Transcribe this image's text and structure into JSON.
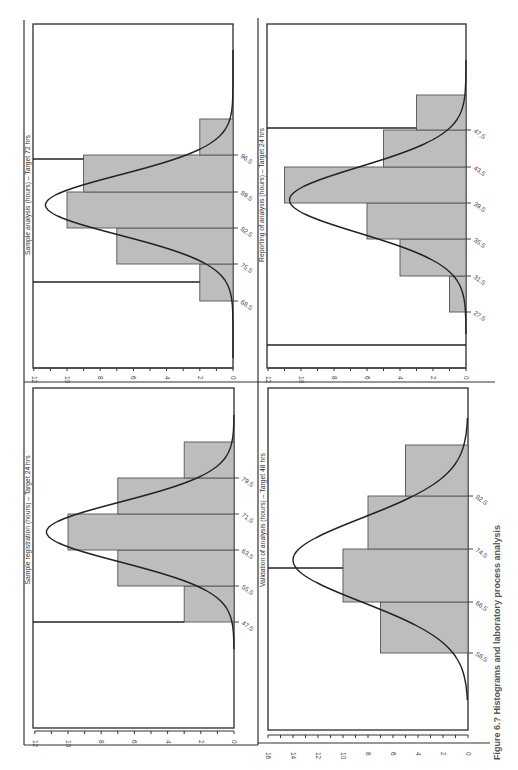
{
  "figure": {
    "caption": "Figure 6.? Histograms and laboratory process analysis",
    "orientation": "rotated 90°"
  },
  "chart_data": [
    {
      "type": "bar",
      "title": "Sample analysis (hours) – Target 72 hrs",
      "xlabel": "Hours",
      "ylabel": "Frequency",
      "bin_edges": [
        68.5,
        75.5,
        82.5,
        89.5,
        96.5
      ],
      "categories": [
        "61.5–68.5",
        "68.5–75.5",
        "75.5–82.5",
        "82.5–89.5",
        "89.5–96.5",
        "96.5–103.5"
      ],
      "values": [
        2,
        2,
        7,
        10,
        9,
        2
      ],
      "normal_curve_peak": 11.3,
      "ylim": [
        0,
        12
      ],
      "yticks": [
        "0",
        "2",
        "4",
        "6",
        "8",
        "10",
        "12"
      ],
      "spec_lines": [
        "lower limit",
        "upper limit"
      ]
    },
    {
      "type": "bar",
      "title": "Reporting of analysis (hours) – Target 24 hrs",
      "xlabel": "Hours",
      "ylabel": "Frequency",
      "bin_edges": [
        27.5,
        31.5,
        35.5,
        39.5,
        43.5,
        47.5
      ],
      "categories": [
        "27.5–31.5",
        "31.5–35.5",
        "35.5–39.5",
        "39.5–43.5",
        "43.5–47.5",
        "47.5–51.5"
      ],
      "values": [
        1,
        4,
        6,
        11,
        5,
        3
      ],
      "normal_curve_peak": 10.7,
      "ylim": [
        0,
        12
      ],
      "yticks": [
        "0",
        "2",
        "4",
        "6",
        "8",
        "10",
        "12"
      ],
      "spec_lines": [
        "lower limit",
        "upper limit"
      ]
    },
    {
      "type": "bar",
      "title": "Sample registration (hours) – Target 24 hrs",
      "xlabel": "Hours",
      "ylabel": "Frequency",
      "bin_edges": [
        47.5,
        55.5,
        63.5,
        71.5,
        79.5
      ],
      "categories": [
        "47.5–55.5",
        "55.5–63.5",
        "63.5–71.5",
        "71.5–79.5",
        "79.5–87.5"
      ],
      "values": [
        3,
        7,
        10,
        7,
        3
      ],
      "normal_curve_peak": 11.3,
      "ylim": [
        0,
        12
      ],
      "yticks": [
        "0",
        "2",
        "4",
        "6",
        "8",
        "10",
        "12"
      ],
      "spec_lines": [
        "lower limit"
      ]
    },
    {
      "type": "bar",
      "title": "Validation of analysis (hours) – Target 48 hrs",
      "xlabel": "Hours",
      "ylabel": "Frequency",
      "bin_edges": [
        58.5,
        66.5,
        74.5,
        82.5
      ],
      "categories": [
        "58.5–66.5",
        "66.5–74.5",
        "74.5–82.5",
        "82.5–90.5"
      ],
      "values": [
        7,
        10,
        8,
        5
      ],
      "normal_curve_peak": 14,
      "ylim": [
        0,
        16
      ],
      "yticks": [
        "0",
        "2",
        "4",
        "6",
        "8",
        "10",
        "12",
        "14",
        "16"
      ],
      "spec_lines": [
        "target limit"
      ]
    }
  ],
  "layout_panels": [
    {
      "frame": {
        "x": 33,
        "y": 24,
        "right": 233,
        "bottom": 368
      },
      "title_x": 30,
      "title_y": 195,
      "base_x": 233,
      "scale": 16.6,
      "vmax": 12,
      "tick_y": 368,
      "label_y": 376,
      "edges_y": [
        301,
        264,
        228,
        192,
        155
      ],
      "edge_labels": [
        "68.5",
        "75.5",
        "82.5",
        "89.5",
        "96.5"
      ],
      "bars": [
        {
          "y0": 264,
          "y1": 301,
          "v": 2
        },
        {
          "y0": 228,
          "y1": 264,
          "v": 7
        },
        {
          "y0": 192,
          "y1": 228,
          "v": 10
        },
        {
          "y0": 155,
          "y1": 192,
          "v": 9
        },
        {
          "y0": 119,
          "y1": 155,
          "v": 2
        }
      ],
      "curve": {
        "mu_y": 205,
        "sigma": 30,
        "peak": 11.3,
        "y_from": 50,
        "y_to": 358
      },
      "spec": [
        {
          "y": 282,
          "to_v": 2
        },
        {
          "y": 159,
          "to_v": 9
        }
      ]
    },
    {
      "frame": {
        "x": 267,
        "y": 24,
        "right": 466,
        "bottom": 368
      },
      "title_x": 264,
      "title_y": 195,
      "base_x": 466,
      "scale": 16.5,
      "vmax": 12,
      "tick_y": 368,
      "label_y": 376,
      "edges_y": [
        312,
        276,
        239,
        203,
        167,
        130
      ],
      "edge_labels": [
        "27.5",
        "31.5",
        "35.5",
        "39.5",
        "43.5",
        "47.5"
      ],
      "bars": [
        {
          "y0": 276,
          "y1": 312,
          "v": 1
        },
        {
          "y0": 239,
          "y1": 276,
          "v": 4
        },
        {
          "y0": 203,
          "y1": 239,
          "v": 6
        },
        {
          "y0": 167,
          "y1": 203,
          "v": 11
        },
        {
          "y0": 130,
          "y1": 167,
          "v": 5
        },
        {
          "y0": 95,
          "y1": 130,
          "v": 3
        }
      ],
      "curve": {
        "mu_y": 200,
        "sigma": 33,
        "peak": 10.7,
        "y_from": 60,
        "y_to": 334
      },
      "spec": [
        {
          "y": 345,
          "to_v": 0
        },
        {
          "y": 128,
          "to_v": 3
        }
      ]
    },
    {
      "frame": {
        "x": 33,
        "y": 388,
        "right": 234,
        "bottom": 728
      },
      "title_x": 30,
      "title_y": 520,
      "base_x": 234,
      "scale": 16.6,
      "vmax": 12,
      "tick_y": 731,
      "label_y": 740,
      "edges_y": [
        622,
        586,
        550,
        514,
        478
      ],
      "edge_labels": [
        "47.5",
        "55.5",
        "63.5",
        "71.5",
        "79.5"
      ],
      "bars": [
        {
          "y0": 586,
          "y1": 622,
          "v": 3
        },
        {
          "y0": 550,
          "y1": 586,
          "v": 7
        },
        {
          "y0": 514,
          "y1": 550,
          "v": 10
        },
        {
          "y0": 478,
          "y1": 514,
          "v": 7
        },
        {
          "y0": 442,
          "y1": 478,
          "v": 3
        }
      ],
      "curve": {
        "mu_y": 532,
        "sigma": 30,
        "peak": 11.3,
        "y_from": 415,
        "y_to": 650
      },
      "spec": [
        {
          "y": 622,
          "to_v": 3
        }
      ]
    },
    {
      "frame": {
        "x": 268,
        "y": 388,
        "right": 468,
        "bottom": 730
      },
      "title_x": 265,
      "title_y": 520,
      "base_x": 468,
      "scale": 12.5,
      "vmax": 16,
      "tick_y": 735,
      "label_y": 752,
      "edges_y": [
        653,
        602,
        549,
        496
      ],
      "edge_labels": [
        "58.5",
        "66.5",
        "74.5",
        "82.5"
      ],
      "bars": [
        {
          "y0": 602,
          "y1": 653,
          "v": 7
        },
        {
          "y0": 549,
          "y1": 602,
          "v": 10
        },
        {
          "y0": 496,
          "y1": 549,
          "v": 8
        },
        {
          "y0": 445,
          "y1": 496,
          "v": 5
        }
      ],
      "curve": {
        "mu_y": 560,
        "sigma": 42,
        "peak": 14,
        "y_from": 418,
        "y_to": 700
      },
      "spec": [
        {
          "y": 568,
          "to_v": 10
        }
      ]
    }
  ]
}
